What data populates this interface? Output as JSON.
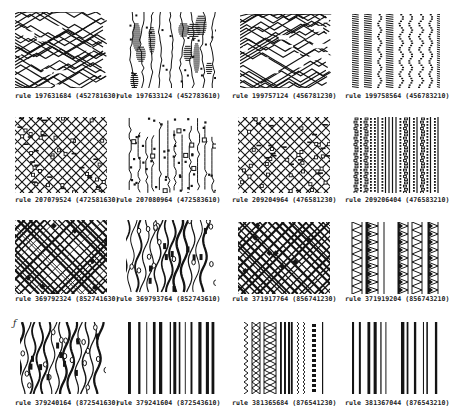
{
  "figure": {
    "ink_color": "#141414",
    "background": "#ffffff",
    "corner_mark": "ƒ",
    "panels": [
      {
        "caption": "rule 197631684 (452781630)",
        "style": "zigzag",
        "seed": 11,
        "x": 15,
        "y": 12,
        "w": 92,
        "h": 76,
        "cx": 15,
        "cy": 92
      },
      {
        "caption": "rule 197633124 (452783610)",
        "style": "blobs",
        "seed": 12,
        "x": 126,
        "y": 12,
        "w": 90,
        "h": 76,
        "cx": 116,
        "cy": 92
      },
      {
        "caption": "rule 199757124 (456781230)",
        "style": "zigzag",
        "seed": 13,
        "x": 240,
        "y": 14,
        "w": 92,
        "h": 74,
        "cx": 232,
        "cy": 92
      },
      {
        "caption": "rule 199758564 (456783210)",
        "style": "stripes",
        "seed": 14,
        "x": 350,
        "y": 14,
        "w": 90,
        "h": 74,
        "cx": 345,
        "cy": 92
      },
      {
        "caption": "rule 207079524 (472581630)",
        "style": "network",
        "seed": 21,
        "x": 15,
        "y": 117,
        "w": 92,
        "h": 76,
        "cx": 15,
        "cy": 196
      },
      {
        "caption": "rule 207080964 (472583610)",
        "style": "dots",
        "seed": 22,
        "x": 126,
        "y": 117,
        "w": 90,
        "h": 76,
        "cx": 116,
        "cy": 196
      },
      {
        "caption": "rule 209204964 (476581230)",
        "style": "network",
        "seed": 23,
        "x": 238,
        "y": 117,
        "w": 92,
        "h": 76,
        "cx": 232,
        "cy": 196
      },
      {
        "caption": "rule 209206404 (476583210)",
        "style": "dotstripes",
        "seed": 24,
        "x": 352,
        "y": 117,
        "w": 88,
        "h": 76,
        "cx": 345,
        "cy": 196
      },
      {
        "caption": "rule 369792324 (852741630)",
        "style": "diagonal",
        "seed": 31,
        "x": 15,
        "y": 220,
        "w": 92,
        "h": 74,
        "cx": 15,
        "cy": 295
      },
      {
        "caption": "rule 369793764 (852743610)",
        "style": "wavy",
        "seed": 32,
        "x": 126,
        "y": 220,
        "w": 90,
        "h": 74,
        "cx": 116,
        "cy": 295
      },
      {
        "caption": "rule 371917764 (856741230)",
        "style": "diagonal",
        "seed": 33,
        "x": 238,
        "y": 222,
        "w": 92,
        "h": 72,
        "cx": 232,
        "cy": 295
      },
      {
        "caption": "rule 371919204 (856743210)",
        "style": "braids",
        "seed": 34,
        "x": 350,
        "y": 222,
        "w": 90,
        "h": 72,
        "cx": 345,
        "cy": 295
      },
      {
        "caption": "rule 379240164 (872541630)",
        "style": "wavy",
        "seed": 41,
        "x": 20,
        "y": 322,
        "w": 86,
        "h": 72,
        "cx": 15,
        "cy": 399
      },
      {
        "caption": "rule 379241604 (872543610)",
        "style": "barcode",
        "seed": 42,
        "x": 126,
        "y": 322,
        "w": 90,
        "h": 72,
        "cx": 116,
        "cy": 399
      },
      {
        "caption": "rule 381365684 (876541230)",
        "style": "mixedbars",
        "seed": 43,
        "x": 242,
        "y": 322,
        "w": 90,
        "h": 72,
        "cx": 232,
        "cy": 399
      },
      {
        "caption": "rule 381367044 (876543210)",
        "style": "barcode",
        "seed": 44,
        "x": 350,
        "y": 322,
        "w": 90,
        "h": 72,
        "cx": 345,
        "cy": 399
      }
    ]
  }
}
